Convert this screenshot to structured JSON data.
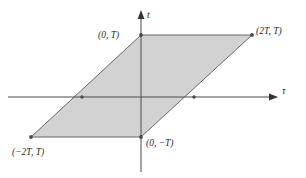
{
  "figure": {
    "kind": "coordinate-plane-region-plot",
    "canvas": {
      "width": 306,
      "height": 178
    },
    "background_color": "#ffffff",
    "region": {
      "name": "shaded-parallelogram",
      "fill_color": "#d2d2d2",
      "stroke_color": "#5a5a5a",
      "vertices_px": [
        {
          "x": 141,
          "y": 35
        },
        {
          "x": 252,
          "y": 35
        },
        {
          "x": 141,
          "y": 137
        },
        {
          "x": 31,
          "y": 137
        }
      ]
    },
    "axes": {
      "origin_px": {
        "x": 141,
        "y": 97
      },
      "stroke_color": "#4a4a4a",
      "vertical": {
        "label": "t",
        "x_px": 141,
        "y_start_px": 10,
        "y_end_px": 172,
        "arrow": "up"
      },
      "horizontal": {
        "label": "τ",
        "y_px": 97,
        "x_start_px": 8,
        "x_end_px": 278,
        "arrow": "right"
      }
    },
    "markers": [
      {
        "name": "vertex-top-left",
        "x": 141,
        "y": 35
      },
      {
        "name": "vertex-top-right",
        "x": 252,
        "y": 35
      },
      {
        "name": "vertex-bottom-center",
        "x": 141,
        "y": 137
      },
      {
        "name": "vertex-bottom-left",
        "x": 31,
        "y": 137
      },
      {
        "name": "axis-crossing-left",
        "x": 82,
        "y": 97
      },
      {
        "name": "axis-crossing-right",
        "x": 194,
        "y": 97
      }
    ],
    "labels": {
      "top_left_vertex": "(0, T)",
      "top_right_vertex": "(2T, T)",
      "bottom_left_vertex": "(−2T, T)",
      "bottom_center_vertex": "(0, −T)",
      "vertical_axis": "t",
      "horizontal_axis": "τ"
    }
  }
}
